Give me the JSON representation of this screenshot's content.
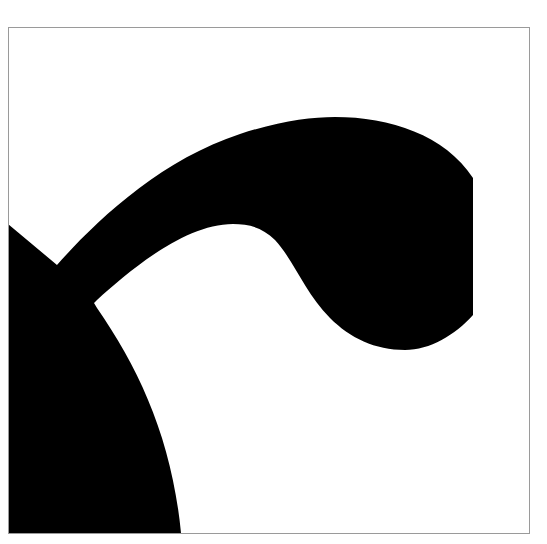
{
  "figure": {
    "colors": {
      "background": "#ffffff",
      "glyph": "#000000",
      "frame_border": "#9a9a9a"
    },
    "frame": {
      "x": 8,
      "y": 27,
      "width": 522,
      "height": 507
    }
  }
}
